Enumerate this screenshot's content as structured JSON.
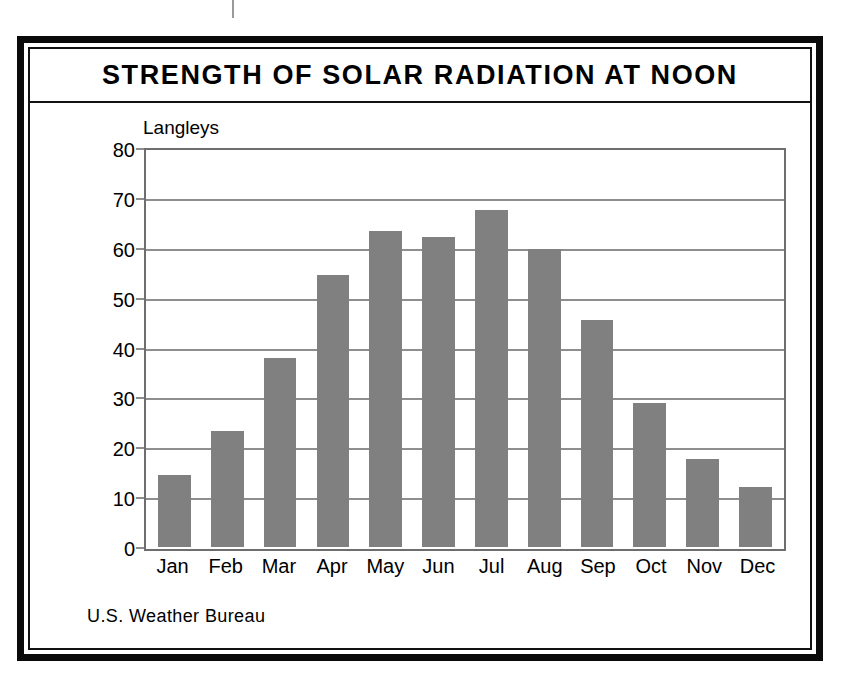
{
  "frame": {
    "title": "STRENGTH OF SOLAR RADIATION AT NOON"
  },
  "source_note": "U.S. Weather Bureau",
  "colors": {
    "bar_fill": "#808080",
    "frame": "#0a0a0a",
    "gridline": "#8e8e8e",
    "text": "#000000"
  },
  "chart_data": {
    "type": "bar",
    "title": "STRENGTH OF SOLAR RADIATION AT NOON",
    "subtitle": "",
    "xlabel": "",
    "ylabel": "Langleys",
    "unit_label": "Langleys",
    "categories": [
      "Jan",
      "Feb",
      "Mar",
      "Apr",
      "May",
      "Jun",
      "Jul",
      "Aug",
      "Sep",
      "Oct",
      "Nov",
      "Dec"
    ],
    "values": [
      14.5,
      23.5,
      38.3,
      55.0,
      64.0,
      62.7,
      68.3,
      60.3,
      46.0,
      29.2,
      17.9,
      12.1
    ],
    "ylim": [
      0,
      80
    ],
    "ytick_labels": [
      "80",
      "70",
      "60",
      "50",
      "40",
      "30",
      "20",
      "10",
      "0"
    ],
    "ytick_values": [
      80,
      70,
      60,
      50,
      40,
      30,
      20,
      10,
      0
    ],
    "ytick_step": 10,
    "grid": true,
    "legend": false,
    "legend_position": "none",
    "source": "U.S. Weather Bureau"
  }
}
